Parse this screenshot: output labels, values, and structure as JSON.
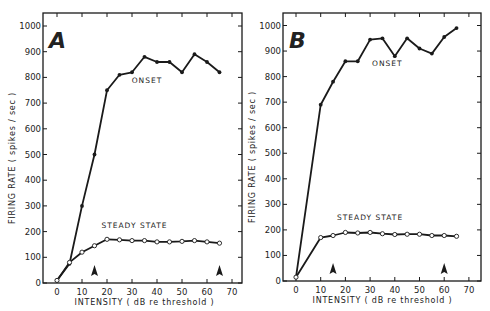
{
  "chart_data": [
    {
      "type": "line",
      "panel": "A",
      "title": "A",
      "xlabel": "INTENSITY ( dB re threshold )",
      "ylabel": "FIRING RATE ( spikes / sec )",
      "xlim": [
        -5,
        75
      ],
      "ylim": [
        0,
        1050
      ],
      "xticks": [
        0,
        10,
        20,
        30,
        40,
        50,
        60,
        70
      ],
      "yticks": [
        0,
        100,
        200,
        300,
        400,
        500,
        600,
        700,
        800,
        900,
        1000
      ],
      "grid": false,
      "series": [
        {
          "name": "ONSET",
          "marker": "filled-circle",
          "x": [
            0,
            5,
            10,
            15,
            20,
            25,
            30,
            35,
            40,
            45,
            50,
            55,
            60,
            65
          ],
          "values": [
            10,
            75,
            300,
            500,
            750,
            810,
            820,
            880,
            860,
            860,
            820,
            890,
            860,
            820
          ]
        },
        {
          "name": "STEADY STATE",
          "marker": "open-circle",
          "x": [
            0,
            5,
            10,
            15,
            20,
            25,
            30,
            35,
            40,
            45,
            50,
            55,
            60,
            65
          ],
          "values": [
            10,
            80,
            120,
            145,
            170,
            168,
            165,
            165,
            160,
            160,
            162,
            165,
            160,
            155
          ]
        }
      ],
      "annotations": [
        {
          "type": "arrowhead",
          "x": 15,
          "label": ""
        },
        {
          "type": "arrowhead",
          "x": 65,
          "label": ""
        }
      ],
      "series_label_positions": {
        "ONSET": {
          "x": 36,
          "y": 780
        },
        "STEADY STATE": {
          "x": 31,
          "y": 215
        }
      }
    },
    {
      "type": "line",
      "panel": "B",
      "title": "B",
      "xlabel": "INTENSITY ( dB re threshold )",
      "ylabel": "FIRING RATE ( spikes / sec )",
      "xlim": [
        -5,
        75
      ],
      "ylim": [
        0,
        1050
      ],
      "xticks": [
        0,
        10,
        20,
        30,
        40,
        50,
        60,
        70
      ],
      "yticks": [
        0,
        100,
        200,
        300,
        400,
        500,
        600,
        700,
        800,
        900,
        1000
      ],
      "grid": false,
      "series": [
        {
          "name": "ONSET",
          "marker": "filled-circle",
          "x": [
            0,
            10,
            15,
            20,
            25,
            30,
            35,
            40,
            45,
            50,
            55,
            60,
            65
          ],
          "values": [
            15,
            690,
            780,
            860,
            860,
            945,
            950,
            880,
            950,
            910,
            890,
            955,
            990
          ]
        },
        {
          "name": "STEADY STATE",
          "marker": "open-circle",
          "x": [
            0,
            10,
            15,
            20,
            25,
            30,
            35,
            40,
            45,
            50,
            55,
            60,
            65
          ],
          "values": [
            15,
            170,
            178,
            190,
            188,
            190,
            185,
            182,
            183,
            183,
            178,
            178,
            175
          ]
        }
      ],
      "annotations": [
        {
          "type": "arrowhead",
          "x": 15,
          "label": ""
        },
        {
          "type": "arrowhead",
          "x": 60,
          "label": ""
        }
      ],
      "series_label_positions": {
        "ONSET": {
          "x": 37,
          "y": 840
        },
        "STEADY STATE": {
          "x": 30,
          "y": 238
        }
      }
    }
  ],
  "panels": [
    {
      "letter": "A",
      "box": {
        "left": 43,
        "top": 13,
        "right": 242,
        "bottom": 283
      },
      "x0px": 57,
      "xscale": 2.5,
      "y0px": 283,
      "yscale": 0.257
    },
    {
      "letter": "B",
      "box": {
        "left": 283,
        "top": 13,
        "right": 481,
        "bottom": 281
      },
      "x0px": 296,
      "xscale": 2.47,
      "y0px": 281,
      "yscale": 0.2555
    }
  ],
  "style": {
    "line_color": "#1a1a1a",
    "background": "#ffffff"
  }
}
